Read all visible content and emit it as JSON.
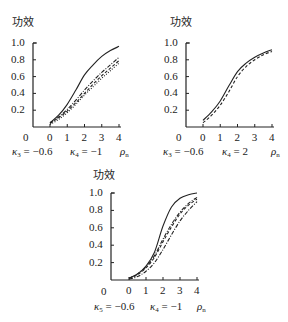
{
  "chart_data": [
    {
      "type": "line",
      "title": "功效",
      "ylabel": "功效",
      "xlabel": "ρₙ",
      "xlim": [
        0,
        4
      ],
      "ylim": [
        0,
        1.0
      ],
      "x_ticks": [
        "0",
        "1",
        "2",
        "3",
        "4"
      ],
      "y_ticks": [
        "0.2",
        "0.4",
        "0.6",
        "0.8",
        "1.0"
      ],
      "origin_label": "0",
      "grid": false,
      "params": {
        "k3_label": "κ",
        "k3_sub": "3",
        "k3_value": "= −0.6",
        "k4_label": "κ",
        "k4_sub": "4",
        "k4_value": "= −1",
        "axis_var": "ρ",
        "axis_sub": "n"
      },
      "x": [
        0,
        0.5,
        1,
        1.5,
        2,
        2.5,
        3,
        3.5,
        4
      ],
      "series": [
        {
          "name": "solid",
          "style": "solid",
          "values": [
            0.05,
            0.14,
            0.27,
            0.44,
            0.62,
            0.74,
            0.84,
            0.91,
            0.96
          ]
        },
        {
          "name": "dash-dot",
          "style": "dashdot",
          "values": [
            0.05,
            0.12,
            0.21,
            0.32,
            0.44,
            0.55,
            0.65,
            0.74,
            0.83
          ]
        },
        {
          "name": "dashed",
          "style": "dashed",
          "values": [
            0.04,
            0.11,
            0.19,
            0.29,
            0.4,
            0.51,
            0.61,
            0.7,
            0.79
          ]
        },
        {
          "name": "dotted",
          "style": "dotted",
          "values": [
            0.03,
            0.09,
            0.17,
            0.27,
            0.38,
            0.48,
            0.58,
            0.67,
            0.76
          ]
        }
      ]
    },
    {
      "type": "line",
      "title": "功效",
      "ylabel": "功效",
      "xlabel": "ρₙ",
      "xlim": [
        0,
        4
      ],
      "ylim": [
        0,
        1.0
      ],
      "x_ticks": [
        "0",
        "1",
        "2",
        "3",
        "4"
      ],
      "y_ticks": [
        "0.2",
        "0.4",
        "0.6",
        "0.8",
        "1.0"
      ],
      "origin_label": "0",
      "grid": false,
      "params": {
        "k3_label": "κ",
        "k3_sub": "3",
        "k3_value": "= −0.6",
        "k4_label": "κ",
        "k4_sub": "4",
        "k4_value": "= 2",
        "axis_var": "ρ",
        "axis_sub": "n"
      },
      "x": [
        0,
        0.5,
        1,
        1.5,
        2,
        2.5,
        3,
        3.5,
        4
      ],
      "series": [
        {
          "name": "solid",
          "style": "solid",
          "values": [
            0.08,
            0.18,
            0.31,
            0.49,
            0.66,
            0.76,
            0.83,
            0.88,
            0.92
          ]
        },
        {
          "name": "dashed",
          "style": "dashed",
          "values": [
            0.05,
            0.14,
            0.26,
            0.42,
            0.6,
            0.72,
            0.8,
            0.86,
            0.9
          ]
        }
      ]
    },
    {
      "type": "line",
      "title": "功效",
      "ylabel": "功效",
      "xlabel": "ρₙ",
      "xlim": [
        0,
        4
      ],
      "ylim": [
        0,
        1.0
      ],
      "x_ticks": [
        "0",
        "1",
        "2",
        "3",
        "4"
      ],
      "y_ticks": [
        "0.2",
        "0.4",
        "0.6",
        "0.8",
        "1.0"
      ],
      "origin_label": "0",
      "grid": false,
      "params": {
        "k3_label": "κ",
        "k3_sub": "5",
        "k3_value": "= −0.6",
        "k4_label": "κ",
        "k4_sub": "4",
        "k4_value": "= −1",
        "axis_var": "ρ",
        "axis_sub": "n"
      },
      "x": [
        0,
        0.5,
        1,
        1.5,
        2,
        2.5,
        3,
        3.5,
        4
      ],
      "series": [
        {
          "name": "solid",
          "style": "solid",
          "values": [
            0.02,
            0.07,
            0.16,
            0.32,
            0.62,
            0.84,
            0.94,
            0.98,
            1.0
          ]
        },
        {
          "name": "dash-dot-1",
          "style": "dashdot",
          "values": [
            0.02,
            0.07,
            0.15,
            0.28,
            0.47,
            0.64,
            0.78,
            0.88,
            0.95
          ]
        },
        {
          "name": "dashed",
          "style": "dashed",
          "values": [
            0.02,
            0.06,
            0.14,
            0.26,
            0.44,
            0.61,
            0.76,
            0.86,
            0.93
          ]
        },
        {
          "name": "dash-dot-2",
          "style": "dashdot",
          "values": [
            0.01,
            0.04,
            0.1,
            0.2,
            0.35,
            0.52,
            0.68,
            0.8,
            0.9
          ]
        }
      ]
    }
  ]
}
